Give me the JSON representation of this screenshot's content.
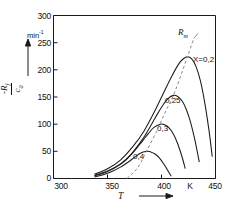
{
  "chart_data": {
    "type": "line",
    "title": "",
    "xlabel": "T",
    "ylabel_numerator": "-R",
    "ylabel_numerator_sub": "f",
    "ylabel_denominator": "c",
    "ylabel_denominator_sub": "0",
    "yunit": "min",
    "yunit_exp": "-1",
    "xunit": "K",
    "xlim": [
      300,
      450
    ],
    "ylim": [
      0,
      300
    ],
    "xticks": [
      300,
      350,
      400,
      450
    ],
    "yticks": [
      0,
      50,
      100,
      150,
      200,
      250,
      300
    ],
    "grid": false,
    "legend": "inline-labels",
    "annotations": [
      {
        "text": "R",
        "sub": "m",
        "note": "locus of maxima (dashed)"
      }
    ],
    "locus_label": "R",
    "locus_label_sub": "m",
    "series": [
      {
        "name": "X=0,2",
        "label": "X=0,2",
        "peak_x": 424,
        "peak_y": 224,
        "x": [
          338,
          350,
          362,
          374,
          384,
          394,
          402,
          410,
          416,
          420,
          424,
          428,
          432,
          436,
          440,
          444,
          447
        ],
        "y": [
          8,
          18,
          34,
          60,
          88,
          125,
          158,
          190,
          211,
          220,
          224,
          220,
          206,
          180,
          140,
          88,
          40
        ]
      },
      {
        "name": "0,25",
        "label": "0,25",
        "peak_x": 411,
        "peak_y": 153,
        "x": [
          338,
          350,
          362,
          372,
          382,
          390,
          396,
          402,
          406,
          411,
          415,
          419,
          423,
          427,
          431,
          435
        ],
        "y": [
          6,
          14,
          27,
          45,
          71,
          97,
          118,
          137,
          147,
          153,
          151,
          143,
          127,
          103,
          70,
          30
        ]
      },
      {
        "name": "0,3",
        "label": "0,3",
        "peak_x": 399,
        "peak_y": 100,
        "x": [
          338,
          348,
          358,
          367,
          375,
          382,
          388,
          393,
          399,
          403,
          407,
          411,
          415,
          419,
          422
        ],
        "y": [
          5,
          11,
          21,
          34,
          51,
          68,
          83,
          94,
          100,
          99,
          93,
          82,
          64,
          40,
          18
        ]
      },
      {
        "name": "0,4",
        "label": "0,4",
        "peak_x": 386,
        "peak_y": 50,
        "x": [
          338,
          346,
          354,
          362,
          369,
          375,
          380,
          386,
          390,
          394,
          398,
          402,
          406,
          409
        ],
        "y": [
          3,
          7,
          13,
          21,
          30,
          39,
          46,
          50,
          49,
          45,
          38,
          27,
          14,
          4
        ]
      }
    ],
    "locus": {
      "name": "Rm",
      "x": [
        368,
        378,
        386,
        395,
        403,
        411,
        418,
        424,
        430
      ],
      "y": [
        0,
        20,
        50,
        85,
        120,
        153,
        190,
        224,
        258
      ]
    }
  },
  "axes": {
    "y_tick_labels": [
      "300",
      "250",
      "200",
      "150",
      "100",
      "50",
      "0"
    ],
    "x_tick_labels": [
      "300",
      "350",
      "400",
      "450"
    ],
    "x_unit_label": "K",
    "y_unit_label": "min",
    "y_unit_exp": "-1"
  },
  "labels": {
    "curve_0": "X=0,2",
    "curve_1": "0,25",
    "curve_2": "0,3",
    "curve_3": "0,4",
    "locus": "R",
    "locus_sub": "m",
    "x_axis_title": "T",
    "y_num": "-R",
    "y_num_sub": "f",
    "y_den": "c",
    "y_den_sub": "0"
  },
  "colors": {
    "ink": "#1a1a1a",
    "curve": "#1a1a1a",
    "locus": "#7a7a7a",
    "background": "#ffffff"
  }
}
